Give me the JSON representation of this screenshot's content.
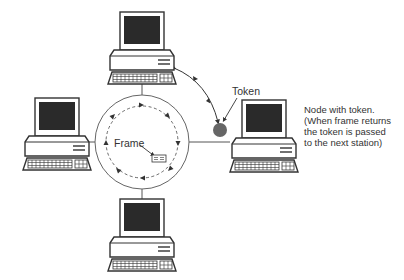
{
  "diagram": {
    "type": "token-ring-network",
    "labels": {
      "token": "Token",
      "frame": "Frame",
      "description_lines": [
        "Node with token.",
        "(When frame returns",
        "the token is passed",
        "to the next station)"
      ]
    },
    "nodes": [
      {
        "id": "top",
        "label": "workstation-top"
      },
      {
        "id": "left",
        "label": "workstation-left"
      },
      {
        "id": "right",
        "label": "workstation-right",
        "has_token": true
      },
      {
        "id": "bottom",
        "label": "workstation-bottom"
      }
    ],
    "ring": {
      "cx": 142,
      "cy": 142,
      "r": 47
    },
    "colors": {
      "line": "#555555",
      "screen": "#2a2a2a",
      "token": "#666666",
      "outline": "#333333"
    }
  }
}
